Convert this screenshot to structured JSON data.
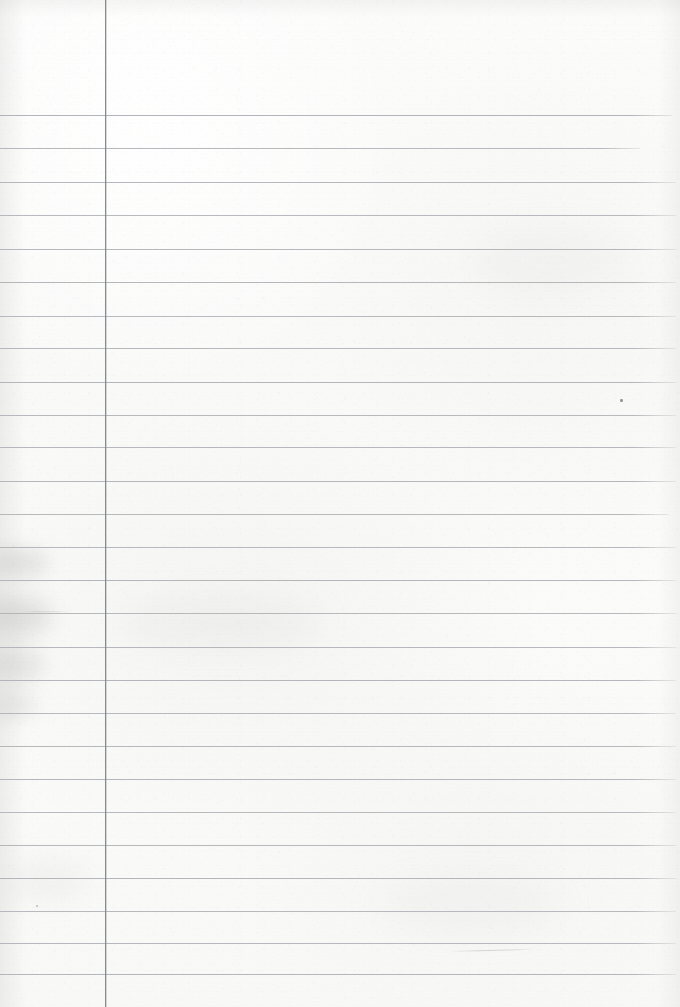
{
  "document": {
    "kind": "scanned-lined-notebook-page",
    "title": "Blank ruled notebook page",
    "page_width": 680,
    "page_height": 1007,
    "content_text": "",
    "has_handwriting": false,
    "orientation": "portrait"
  },
  "colors": {
    "paper": "#fbfbfa",
    "paper_shade": "#f5f5f4",
    "horizontal_rule": "#b4b8bc",
    "vertical_rule": "#8d9095",
    "blemish": "#9a9c9e",
    "speck": "#6d6f70",
    "backdrop": "#767676"
  },
  "margin_rule": {
    "name": "vertical-margin-line",
    "x": 105,
    "top": 0,
    "bottom": 1007,
    "thickness": 1
  },
  "ruling": {
    "first_line_y": 115,
    "line_spacing": 33.7,
    "line_count": 26,
    "left_x": 0,
    "right_x": 674,
    "thickness": 1
  },
  "horizontal_rules": [
    {
      "y": 115,
      "x1": 0,
      "x2": 672,
      "opacity": 0.95
    },
    {
      "y": 148,
      "x1": 0,
      "x2": 640,
      "opacity": 0.9
    },
    {
      "y": 182,
      "x1": 0,
      "x2": 676,
      "opacity": 0.92
    },
    {
      "y": 215,
      "x1": 0,
      "x2": 676,
      "opacity": 0.88
    },
    {
      "y": 249,
      "x1": 0,
      "x2": 676,
      "opacity": 0.9
    },
    {
      "y": 282,
      "x1": 0,
      "x2": 676,
      "opacity": 0.92
    },
    {
      "y": 316,
      "x1": 0,
      "x2": 676,
      "opacity": 0.88
    },
    {
      "y": 348,
      "x1": 0,
      "x2": 676,
      "opacity": 0.9
    },
    {
      "y": 382,
      "x1": 0,
      "x2": 676,
      "opacity": 0.92
    },
    {
      "y": 415,
      "x1": 0,
      "x2": 676,
      "opacity": 0.88
    },
    {
      "y": 447,
      "x1": 0,
      "x2": 676,
      "opacity": 0.9
    },
    {
      "y": 481,
      "x1": 0,
      "x2": 676,
      "opacity": 0.92
    },
    {
      "y": 514,
      "x1": 0,
      "x2": 668,
      "opacity": 0.88
    },
    {
      "y": 547,
      "x1": 0,
      "x2": 676,
      "opacity": 0.9
    },
    {
      "y": 580,
      "x1": 0,
      "x2": 676,
      "opacity": 0.92
    },
    {
      "y": 613,
      "x1": 0,
      "x2": 676,
      "opacity": 0.88
    },
    {
      "y": 647,
      "x1": 0,
      "x2": 676,
      "opacity": 0.9
    },
    {
      "y": 680,
      "x1": 0,
      "x2": 676,
      "opacity": 0.92
    },
    {
      "y": 713,
      "x1": 0,
      "x2": 676,
      "opacity": 0.88
    },
    {
      "y": 746,
      "x1": 0,
      "x2": 676,
      "opacity": 0.9
    },
    {
      "y": 779,
      "x1": 0,
      "x2": 676,
      "opacity": 0.92
    },
    {
      "y": 812,
      "x1": 0,
      "x2": 676,
      "opacity": 0.88
    },
    {
      "y": 845,
      "x1": 0,
      "x2": 676,
      "opacity": 0.9
    },
    {
      "y": 878,
      "x1": 0,
      "x2": 676,
      "opacity": 0.92
    },
    {
      "y": 911,
      "x1": 0,
      "x2": 676,
      "opacity": 0.88
    },
    {
      "y": 943,
      "x1": 0,
      "x2": 676,
      "opacity": 0.9
    },
    {
      "y": 974,
      "x1": 0,
      "x2": 676,
      "opacity": 0.92
    }
  ],
  "blemishes": [
    {
      "name": "left-edge-smudge-upper",
      "x": -10,
      "y": 548,
      "w": 58,
      "h": 30,
      "color": "rgba(150,150,148,0.22)",
      "blur": 9
    },
    {
      "name": "left-edge-smudge-mid",
      "x": -14,
      "y": 596,
      "w": 64,
      "h": 40,
      "color": "rgba(145,145,143,0.26)",
      "blur": 11
    },
    {
      "name": "left-edge-smudge-lower",
      "x": -12,
      "y": 648,
      "w": 56,
      "h": 34,
      "color": "rgba(150,150,148,0.22)",
      "blur": 10
    },
    {
      "name": "left-edge-smudge-bottom",
      "x": -10,
      "y": 692,
      "w": 46,
      "h": 26,
      "color": "rgba(155,155,153,0.18)",
      "blur": 9
    },
    {
      "name": "upper-left-tone-patch",
      "x": 8,
      "y": 860,
      "w": 80,
      "h": 40,
      "color": "rgba(205,205,203,0.18)",
      "blur": 14
    },
    {
      "name": "center-tone-patch",
      "x": 120,
      "y": 600,
      "w": 200,
      "h": 44,
      "color": "rgba(206,206,204,0.16)",
      "blur": 16
    },
    {
      "name": "right-tone-patch",
      "x": 470,
      "y": 230,
      "w": 160,
      "h": 60,
      "color": "rgba(208,208,206,0.13)",
      "blur": 18
    },
    {
      "name": "lower-right-tone-patch",
      "x": 380,
      "y": 880,
      "w": 180,
      "h": 50,
      "color": "rgba(207,207,205,0.13)",
      "blur": 18
    }
  ],
  "specks": [
    {
      "name": "ink-speck-right",
      "x": 620,
      "y": 399,
      "w": 3,
      "h": 3,
      "opacity": 0.72
    },
    {
      "name": "ink-speck-left",
      "x": 36,
      "y": 905,
      "w": 2,
      "h": 2,
      "opacity": 0.45
    }
  ],
  "stray_marks": [
    {
      "name": "faint-pencil-stroke",
      "x": 448,
      "y": 951,
      "length": 88,
      "angle": -1.4,
      "opacity": 0.55
    },
    {
      "name": "faint-pencil-stroke-short",
      "x": 20,
      "y": 611,
      "length": 52,
      "angle": 0.4,
      "opacity": 0.35
    }
  ]
}
